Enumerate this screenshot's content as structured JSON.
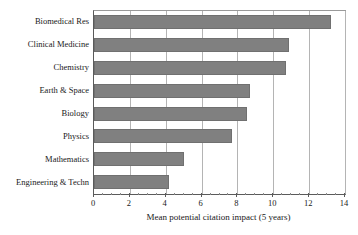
{
  "chart_data": {
    "type": "bar",
    "orientation": "horizontal",
    "title": "",
    "xlabel": "Mean potential citation impact (5 years)",
    "ylabel": "",
    "categories": [
      "Biomedical Res",
      "Clinical Medicine",
      "Chemistry",
      "Earth & Space",
      "Biology",
      "Physics",
      "Mathematics",
      "Engineering & Techn"
    ],
    "values": [
      13.2,
      10.85,
      10.7,
      8.7,
      8.55,
      7.7,
      5.0,
      4.2
    ],
    "xlim": [
      0,
      14
    ],
    "xticks": [
      0,
      2,
      4,
      6,
      8,
      10,
      12,
      14
    ],
    "xtick_labels": [
      "0",
      "2",
      "4",
      "6",
      "8",
      "10",
      "12",
      "14"
    ],
    "xtick_minor_step": 0.5,
    "grid": "vertical-major",
    "legend": null,
    "bar_color": "#808080",
    "gridline_color": "#b4b4b4",
    "axis_color": "#5a5a5a",
    "background": "#ffffff"
  }
}
